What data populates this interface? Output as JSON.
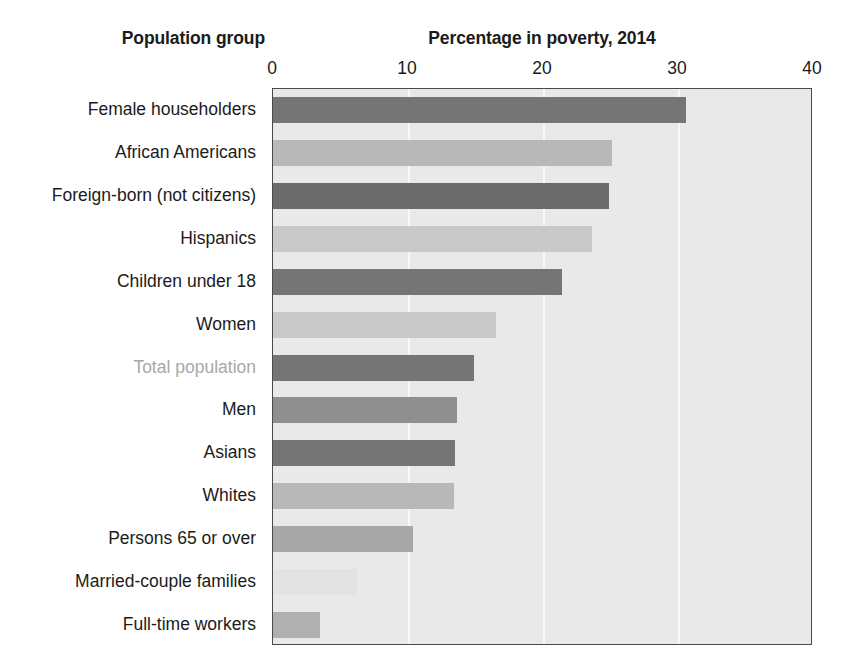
{
  "header": {
    "category_axis_title": "Population group",
    "value_axis_title": "Percentage in poverty, 2014"
  },
  "axis": {
    "ticks": [
      "0",
      "10",
      "20",
      "30",
      "40"
    ],
    "min": 0,
    "max": 40,
    "step": 10
  },
  "colors": {
    "plot_background": "#e9e9e9",
    "plot_border": "#4a4a4a",
    "gridline": "#fafafa",
    "bar_dark": "#757575",
    "bar_darker": "#6b6b6b",
    "bar_medium": "#8f8f8f",
    "bar_light": "#b8b8b8",
    "bar_lighter": "#c9c9c9",
    "bar_faint": "#e3e3e3",
    "label_default": "#1b1b1b",
    "label_highlight": "#a8a8a8"
  },
  "chart_data": {
    "type": "bar",
    "orientation": "horizontal",
    "title": "Percentage in poverty, 2014",
    "xlabel": "Percentage in poverty, 2014",
    "ylabel": "Population group",
    "xlim": [
      0,
      40
    ],
    "xticks": [
      0,
      10,
      20,
      30,
      40
    ],
    "grid": true,
    "legend": "none",
    "categories": [
      "Female householders",
      "African Americans",
      "Foreign-born (not citizens)",
      "Hispanics",
      "Children under 18",
      "Women",
      "Total population",
      "Men",
      "Asians",
      "Whites",
      "Persons 65 or over",
      "Married-couple families",
      "Full-time workers"
    ],
    "values": [
      30.6,
      25.1,
      24.9,
      23.6,
      21.4,
      16.5,
      14.9,
      13.6,
      13.5,
      13.4,
      10.4,
      6.2,
      3.5
    ],
    "bar_colors": [
      "#757575",
      "#b8b8b8",
      "#6b6b6b",
      "#c9c9c9",
      "#757575",
      "#c9c9c9",
      "#757575",
      "#8f8f8f",
      "#757575",
      "#b8b8b8",
      "#a8a8a8",
      "#e3e3e3",
      "#b0b0b0"
    ],
    "label_colors": [
      "#1b1b1b",
      "#1b1b1b",
      "#1b1b1b",
      "#1b1b1b",
      "#1b1b1b",
      "#1b1b1b",
      "#a8a8a8",
      "#1b1b1b",
      "#1b1b1b",
      "#1b1b1b",
      "#1b1b1b",
      "#1b1b1b",
      "#1b1b1b"
    ]
  }
}
